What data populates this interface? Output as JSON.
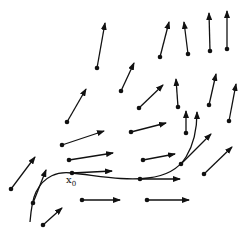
{
  "diagram": {
    "type": "vector-field-with-flow-curve",
    "colors": {
      "stroke": "#111111",
      "background": "#ffffff"
    },
    "vectors": [
      {
        "from": [
          97,
          68
        ],
        "to": [
          105,
          23
        ]
      },
      {
        "from": [
          160,
          57
        ],
        "to": [
          169,
          22
        ]
      },
      {
        "from": [
          188,
          54
        ],
        "to": [
          184,
          22
        ]
      },
      {
        "from": [
          210,
          51
        ],
        "to": [
          209,
          13
        ]
      },
      {
        "from": [
          227,
          49
        ],
        "to": [
          227,
          11
        ]
      },
      {
        "from": [
          121,
          91
        ],
        "to": [
          134,
          63
        ]
      },
      {
        "from": [
          139,
          108
        ],
        "to": [
          163,
          85
        ]
      },
      {
        "from": [
          178,
          107
        ],
        "to": [
          176,
          79
        ]
      },
      {
        "from": [
          209,
          105
        ],
        "to": [
          216,
          74
        ]
      },
      {
        "from": [
          229,
          121
        ],
        "to": [
          236,
          84
        ]
      },
      {
        "from": [
          67,
          122
        ],
        "to": [
          86,
          89
        ]
      },
      {
        "from": [
          62,
          145
        ],
        "to": [
          104,
          131
        ]
      },
      {
        "from": [
          131,
          132
        ],
        "to": [
          166,
          123
        ]
      },
      {
        "from": [
          186,
          133
        ],
        "to": [
          186,
          111
        ]
      },
      {
        "from": [
          69,
          160
        ],
        "to": [
          113,
          153
        ]
      },
      {
        "from": [
          143,
          160
        ],
        "to": [
          175,
          154
        ]
      },
      {
        "from": [
          72,
          173
        ],
        "to": [
          112,
          171
        ]
      },
      {
        "from": [
          140,
          179
        ],
        "to": [
          180,
          179
        ]
      },
      {
        "from": [
          181,
          164
        ],
        "to": [
          211,
          134
        ]
      },
      {
        "from": [
          204,
          174
        ],
        "to": [
          232,
          147
        ]
      },
      {
        "from": [
          11,
          189
        ],
        "to": [
          35,
          157
        ]
      },
      {
        "from": [
          33,
          203
        ],
        "to": [
          46,
          170
        ]
      },
      {
        "from": [
          82,
          200
        ],
        "to": [
          120,
          200
        ]
      },
      {
        "from": [
          147,
          200
        ],
        "to": [
          189,
          200
        ]
      },
      {
        "from": [
          43,
          225
        ],
        "to": [
          62,
          208
        ]
      }
    ],
    "flow_curve": {
      "path": "M30,222 C31,210 32,200 36,192 C44,176 58,171 72,173 C100,176 125,181 148,178 C165,176 178,170 186,157 C194,144 197,128 197,112",
      "arrow_at_end": true,
      "end": [
        197,
        112
      ]
    },
    "point_label": {
      "text": "x",
      "subscript": "0",
      "position": [
        66,
        184
      ]
    }
  }
}
